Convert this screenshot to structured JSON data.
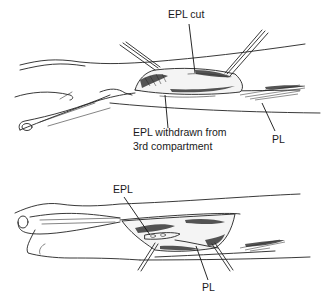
{
  "figure": {
    "top_panel": {
      "labels": {
        "epl_cut": "EPL cut",
        "epl_withdrawn_line1": "EPL withdrawn from",
        "epl_withdrawn_line2": "3rd compartment",
        "pl": "PL"
      }
    },
    "bottom_panel": {
      "labels": {
        "epl": "EPL",
        "pl": "PL"
      }
    },
    "colors": {
      "ink": "#222222",
      "background": "#ffffff"
    }
  }
}
